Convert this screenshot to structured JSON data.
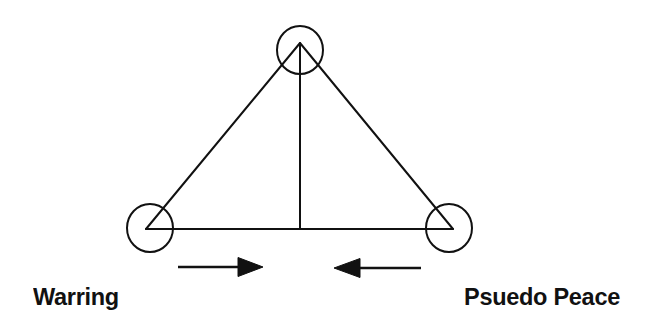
{
  "diagram": {
    "type": "triangle-spectrum",
    "canvas": {
      "width": 653,
      "height": 335,
      "background": "#ffffff"
    },
    "stroke_color": "#111111",
    "stroke_width": 2,
    "triangle": {
      "apex": {
        "x": 300,
        "y": 43
      },
      "left_vertex": {
        "x": 146,
        "y": 229
      },
      "right_vertex": {
        "x": 453,
        "y": 229
      },
      "midline": {
        "x": 300,
        "y1": 43,
        "y2": 229
      }
    },
    "vertex_circles": [
      {
        "name": "apex-circle",
        "cx": 300,
        "cy": 50,
        "rx": 23,
        "ry": 24
      },
      {
        "name": "left-circle",
        "cx": 150,
        "cy": 228,
        "rx": 23,
        "ry": 24
      },
      {
        "name": "right-circle",
        "cx": 449,
        "cy": 228,
        "rx": 23,
        "ry": 24
      }
    ],
    "arrows": [
      {
        "name": "arrow-right",
        "direction": "right",
        "shaft_x1": 178,
        "shaft_x2": 240,
        "y": 267,
        "head_base_x": 238,
        "head_tip_x": 263,
        "head_half_height": 9.5
      },
      {
        "name": "arrow-left",
        "direction": "left",
        "shaft_x1": 358,
        "shaft_x2": 421,
        "y": 268,
        "head_base_x": 360,
        "head_tip_x": 334,
        "head_half_height": 9.5
      }
    ],
    "labels": {
      "left": "Warring",
      "right": "Psuedo Peace"
    }
  }
}
